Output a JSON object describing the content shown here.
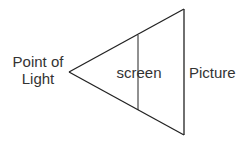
{
  "diagram": {
    "labels": {
      "point_of_light_line1": "Point of",
      "point_of_light_line2": "Light",
      "screen": "screen",
      "picture": "Picture"
    },
    "shapes": {
      "apex": [
        69,
        72
      ],
      "picture_top": [
        184,
        9
      ],
      "picture_bottom": [
        184,
        135
      ],
      "screen_top": [
        138,
        35
      ],
      "screen_bottom": [
        138,
        110
      ]
    },
    "colors": {
      "line": "#222222",
      "text": "#333333",
      "background": "#ffffff"
    }
  }
}
